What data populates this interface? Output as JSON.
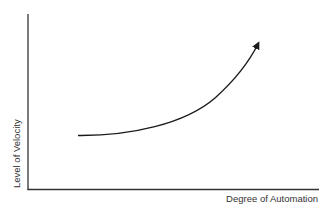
{
  "diagram": {
    "type": "conceptual-curve",
    "x_axis_label": "Degree of Automation",
    "y_axis_label": "Level of Velocity",
    "curve": {
      "description": "Upward-accelerating curve with arrowhead",
      "direction": "increasing",
      "color": "#1a1a1a"
    },
    "axis_color": "#333333",
    "background": "#ffffff"
  }
}
